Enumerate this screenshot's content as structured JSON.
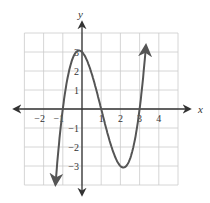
{
  "chart_data": {
    "type": "line",
    "title": "",
    "xlabel": "x",
    "ylabel": "y",
    "xlim": [
      -3,
      5
    ],
    "ylim": [
      -4,
      4
    ],
    "grid": true,
    "x_ticks": [
      -2,
      -1,
      1,
      2,
      3,
      4
    ],
    "y_ticks": [
      -3,
      -2,
      -1,
      1,
      2,
      3
    ],
    "x_tick_labels": [
      "−2",
      "−1",
      "1",
      "2",
      "3",
      "4"
    ],
    "y_tick_labels": [
      "−3",
      "−2",
      "−1",
      "1",
      "2",
      "3"
    ],
    "series": [
      {
        "name": "y = x^3 - 3x^2 - x + 3",
        "description": "Cubic with zeros at x = -1, 1, 3; local max ≈ (0, 3); local min ≈ (2, -3); arrows on both ends",
        "x": [
          -1.4,
          -1,
          -0.5,
          0,
          0.5,
          1,
          1.5,
          2,
          2.5,
          3,
          3.35
        ],
        "values": [
          -4.3,
          0,
          2.6,
          3,
          1.9,
          0,
          -1.9,
          -3,
          -2.6,
          0,
          3.5
        ]
      }
    ],
    "colors": {
      "curve": "#555555",
      "axes": "#333333",
      "grid": "#cccccc"
    }
  }
}
